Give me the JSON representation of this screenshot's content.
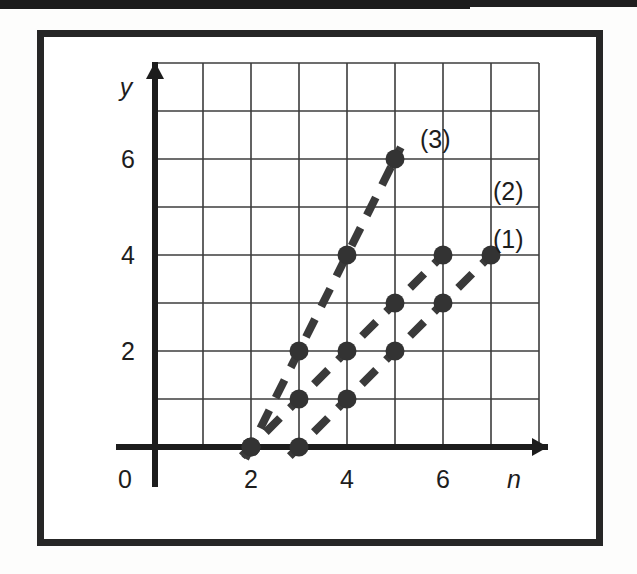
{
  "figure": {
    "frame_color": "#262626",
    "background": "#ffffff"
  },
  "axes": {
    "x_axis_label": "n",
    "y_axis_label": "y",
    "origin_label": "0",
    "x_ticks": [
      "2",
      "4",
      "6"
    ],
    "y_ticks": [
      "2",
      "4",
      "6"
    ],
    "grid": "on"
  },
  "labels": {
    "series1": "(1)",
    "series2": "(2)",
    "series3": "(3)"
  },
  "chart_data": {
    "type": "scatter",
    "title": "",
    "xlabel": "n",
    "ylabel": "y",
    "xlim": [
      0,
      8
    ],
    "ylim": [
      0,
      8
    ],
    "xticks": [
      2,
      4,
      6
    ],
    "yticks": [
      2,
      4,
      6
    ],
    "grid": true,
    "legend_position": "inline-right-of-line-end",
    "marker": "filled-circle",
    "linestyle": "dashed",
    "line_color": "#3a3a3a",
    "marker_color": "#333333",
    "series": [
      {
        "name": "(1)",
        "label": "(1)",
        "slope": 1,
        "intercept": -3,
        "points": [
          {
            "n": 3,
            "y": 0
          },
          {
            "n": 4,
            "y": 1
          },
          {
            "n": 5,
            "y": 2
          },
          {
            "n": 6,
            "y": 3
          },
          {
            "n": 7,
            "y": 4
          }
        ]
      },
      {
        "name": "(2)",
        "label": "(2)",
        "slope": 1,
        "intercept": -2,
        "points": [
          {
            "n": 2,
            "y": 0
          },
          {
            "n": 3,
            "y": 1
          },
          {
            "n": 4,
            "y": 2
          },
          {
            "n": 5,
            "y": 3
          },
          {
            "n": 6,
            "y": 4
          }
        ]
      },
      {
        "name": "(3)",
        "label": "(3)",
        "slope": 2,
        "intercept": -4,
        "points": [
          {
            "n": 2,
            "y": 0
          },
          {
            "n": 3,
            "y": 2
          },
          {
            "n": 4,
            "y": 4
          },
          {
            "n": 5,
            "y": 6
          }
        ]
      }
    ]
  }
}
